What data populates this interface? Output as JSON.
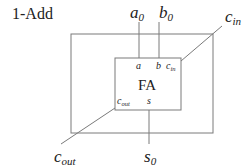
{
  "diagram": {
    "title": "1-Add",
    "inputs": {
      "a": {
        "base": "a",
        "sub": "0"
      },
      "b": {
        "base": "b",
        "sub": "0"
      },
      "cin": {
        "base": "c",
        "sub": "in"
      }
    },
    "outputs": {
      "cout": {
        "base": "c",
        "sub": "out"
      },
      "s": {
        "base": "s",
        "sub": "0"
      }
    },
    "block": {
      "label": "FA",
      "ports": {
        "a": "a",
        "b": "b",
        "cin": {
          "base": "c",
          "sub": "in"
        },
        "cout": {
          "base": "c",
          "sub": "out"
        },
        "s": "s"
      }
    },
    "colors": {
      "line": "#7a7a7a",
      "text": "#222222"
    }
  }
}
